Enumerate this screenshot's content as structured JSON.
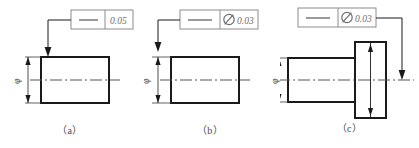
{
  "drawing": {
    "title": "Straightness tolerance examples",
    "background_color": "#ffffff",
    "line_color": "#1a1a1a",
    "frame_color": "#8c8c8c",
    "text_color": "#6e6e6e",
    "centerline_color": "#555555"
  },
  "figures": [
    {
      "id": "figure-a",
      "caption": "（a）",
      "feature_control_frame": {
        "symbol_name": "straightness-symbol",
        "symbol_glyph": "—",
        "diameter_prefix": "",
        "tolerance_value": "0.05",
        "cells": [
          "straightness-symbol",
          "0.05"
        ]
      },
      "dimension": {
        "label": "φ",
        "label_name": "diameter-dimension-phi",
        "orientation": "vertical-rotated"
      },
      "part": {
        "shape": "plain-cylinder",
        "view": "rectangular-side-view"
      },
      "leader": {
        "direction": "down",
        "target": "top-surface-of-cylinder",
        "arrow": "filled-down-arrow"
      }
    },
    {
      "id": "figure-b",
      "caption": "（b）",
      "feature_control_frame": {
        "symbol_name": "straightness-symbol",
        "symbol_glyph": "—",
        "diameter_prefix": "Ø",
        "tolerance_value": "0.03",
        "cells": [
          "straightness-symbol",
          "Ø 0.03"
        ]
      },
      "dimension": {
        "label": "φ",
        "label_name": "diameter-dimension-phi",
        "orientation": "vertical-rotated"
      },
      "part": {
        "shape": "plain-cylinder",
        "view": "rectangular-side-view"
      },
      "leader": {
        "direction": "down",
        "target": "diameter-extension-line",
        "arrow": "filled-down-arrow"
      }
    },
    {
      "id": "figure-c",
      "caption": "（c）",
      "feature_control_frame": {
        "symbol_name": "straightness-symbol",
        "symbol_glyph": "—",
        "diameter_prefix": "Ø",
        "tolerance_value": "0.03",
        "cells": [
          "straightness-symbol",
          "Ø 0.03"
        ]
      },
      "dimension": {
        "label": "φ",
        "label_name": "diameter-dimension-phi",
        "orientation": "vertical-rotated"
      },
      "part": {
        "shape": "stepped-shaft-with-flange",
        "view": "stepped-side-view"
      },
      "leader": {
        "direction": "down",
        "target": "axis-centerline-right",
        "arrow": "filled-down-arrow"
      }
    }
  ]
}
